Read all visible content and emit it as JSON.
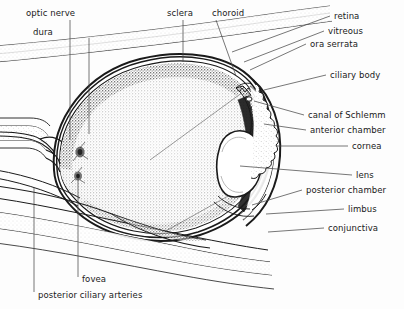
{
  "figure": {
    "background_color": "#fdfdfd",
    "ink_color": "#1a1a1a",
    "width": 404,
    "height": 309
  },
  "labels": {
    "optic_nerve": "optic nerve",
    "dura": "dura",
    "sclera": "sclera",
    "choroid": "choroid",
    "retina": "retina",
    "vitreous": "vitreous",
    "ora_serrata": "ora serrata",
    "ciliary_body": "ciliary body",
    "canal_of_schlemm": "canal of Schlemm",
    "anterior_chamber": "anterior chamber",
    "cornea": "cornea",
    "lens": "lens",
    "posterior_chamber": "posterior chamber",
    "limbus": "limbus",
    "conjunctiva": "conjunctiva",
    "fovea": "fovea",
    "posterior_ciliary_arteries": "posterior ciliary arteries"
  },
  "structures": [
    {
      "name": "optic-nerve",
      "side": "left"
    },
    {
      "name": "dura",
      "side": "left"
    },
    {
      "name": "sclera",
      "side": "top"
    },
    {
      "name": "choroid",
      "side": "top"
    },
    {
      "name": "retina",
      "side": "right"
    },
    {
      "name": "vitreous",
      "side": "right"
    },
    {
      "name": "ora-serrata",
      "side": "right"
    },
    {
      "name": "ciliary-body",
      "side": "right"
    },
    {
      "name": "canal-of-schlemm",
      "side": "right"
    },
    {
      "name": "anterior-chamber",
      "side": "right"
    },
    {
      "name": "cornea",
      "side": "right"
    },
    {
      "name": "lens",
      "side": "right"
    },
    {
      "name": "posterior-chamber",
      "side": "right"
    },
    {
      "name": "limbus",
      "side": "right"
    },
    {
      "name": "conjunctiva",
      "side": "right"
    },
    {
      "name": "fovea",
      "side": "bottom"
    },
    {
      "name": "posterior-ciliary-arteries",
      "side": "bottom"
    }
  ]
}
